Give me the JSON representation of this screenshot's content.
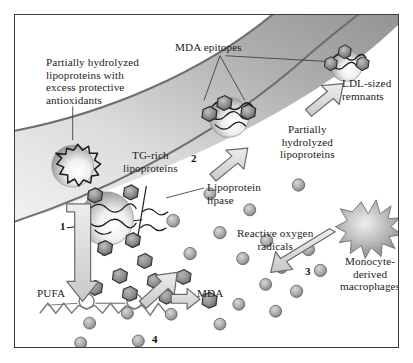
{
  "figure": {
    "background_color": "#ffffff",
    "frame_color": "#3d3d3d",
    "text_color": "#1c1c1c"
  },
  "labels": {
    "partially_hydrolyzed_antioxidants": "Partially hydrolyzed\nlipoproteins with\nexcess protective\nantioxidants",
    "mda_epitopes": "MDA epitopes",
    "ldl_sized_remnants": "LDL-sized\nremnants",
    "partially_hydrolyzed_lipoproteins": "Partially\nhydrolyzed\nlipoproteins",
    "tg_rich_lipoproteins": "TG-rich\nlipoproteins",
    "lipoprotein_lipase": "Lipoprotein\nlipase",
    "reactive_oxygen_radicals": "Reactive oxygen\nradicals",
    "monocyte_derived_macrophages": "Monocyte-\nderived\nmacrophages",
    "pufa": "PUFA",
    "mda": "MDA"
  },
  "step_numbers": {
    "one": "1",
    "two": "2",
    "three": "3",
    "four": "4"
  },
  "colors": {
    "vessel_border": "#6e6e6e",
    "vessel_fill_light": "#f2f2f2",
    "vessel_fill_dark": "#9a9a9a",
    "particle_outline": "#2b2b2b",
    "particle_fill_light": "#fbfbfb",
    "particle_fill_dark": "#9e9e9e",
    "epitope_fill": "#7d7d7d",
    "radical_fill": "#a9a9a9",
    "arrow_outline": "#6a6a6a",
    "arrow_fill": "#d6d6d6",
    "macrophage_fill": "#b4b4b4"
  },
  "elements": {
    "vessel_wall": "curved arterial vessel band crossing the figure diagonally",
    "tg_rich_particle": "triglyceride-rich lipoprotein sphere with jagged apolipoprotein coat",
    "lipase_particle": "large lipoprotein sphere bound by lipoprotein lipase with hexagonal subunits",
    "hydrolyzed_particle": "partially hydrolyzed lipoprotein with MDA epitopes attached",
    "remnant_particle": "LDL-sized remnant particle with MDA epitopes",
    "macrophage": "monocyte-derived macrophage drawn as a spiked starburst",
    "pufa_chain": "polyunsaturated fatty acid zig-zag chain with two double-bond circles",
    "mda_molecule": "malondialdehyde particle",
    "radicals": "scattered reactive oxygen radical spheres"
  },
  "radicals": [
    {
      "x": 196,
      "y": 180,
      "r": 6.0,
      "dark": false
    },
    {
      "x": 236,
      "y": 196,
      "r": 6.0,
      "dark": false
    },
    {
      "x": 285,
      "y": 171,
      "r": 6.2,
      "dark": false
    },
    {
      "x": 159,
      "y": 207,
      "r": 6.4,
      "dark": false
    },
    {
      "x": 206,
      "y": 219,
      "r": 6.2,
      "dark": false
    },
    {
      "x": 253,
      "y": 227,
      "r": 6.2,
      "dark": false
    },
    {
      "x": 295,
      "y": 236,
      "r": 6.2,
      "dark": false
    },
    {
      "x": 176,
      "y": 240,
      "r": 6.2,
      "dark": false
    },
    {
      "x": 229,
      "y": 245,
      "r": 6.2,
      "dark": false
    },
    {
      "x": 268,
      "y": 254,
      "r": 6.0,
      "dark": false
    },
    {
      "x": 307,
      "y": 257,
      "r": 6.2,
      "dark": false
    },
    {
      "x": 252,
      "y": 271,
      "r": 6.0,
      "dark": false
    },
    {
      "x": 283,
      "y": 278,
      "r": 6.2,
      "dark": false
    },
    {
      "x": 225,
      "y": 291,
      "r": 6.0,
      "dark": false
    },
    {
      "x": 262,
      "y": 298,
      "r": 6.0,
      "dark": false
    },
    {
      "x": 206,
      "y": 311,
      "r": 6.0,
      "dark": false
    },
    {
      "x": 157,
      "y": 301,
      "r": 6.0,
      "dark": false
    },
    {
      "x": 113,
      "y": 300,
      "r": 6.0,
      "dark": false
    },
    {
      "x": 75,
      "y": 310,
      "r": 6.0,
      "dark": false
    },
    {
      "x": 66,
      "y": 330,
      "r": 6.0,
      "dark": false
    },
    {
      "x": 124,
      "y": 328,
      "r": 6.0,
      "dark": false
    }
  ],
  "mda_particles": [
    {
      "x": 131,
      "y": 248,
      "r": 7.0
    },
    {
      "x": 106,
      "y": 263,
      "r": 7.4
    },
    {
      "x": 141,
      "y": 268,
      "r": 7.2
    },
    {
      "x": 81,
      "y": 275,
      "r": 7.2
    },
    {
      "x": 116,
      "y": 281,
      "r": 7.2
    },
    {
      "x": 153,
      "y": 284,
      "r": 7.0
    },
    {
      "x": 189,
      "y": 289,
      "r": 7.4
    }
  ]
}
